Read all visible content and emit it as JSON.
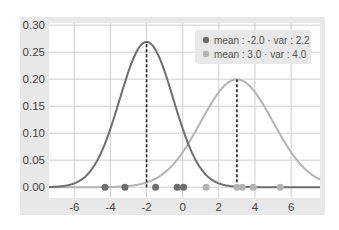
{
  "chart_data": {
    "type": "line",
    "title": "",
    "xlabel": "",
    "ylabel": "",
    "xlim": [
      -7.4,
      7.6
    ],
    "ylim": [
      -0.02,
      0.304
    ],
    "grid": true,
    "legend_position": "upper right",
    "x_ticks": [
      -6,
      -4,
      -2,
      0,
      2,
      4,
      6
    ],
    "x_tick_labels": [
      "-6",
      "-4",
      "-2",
      "0",
      "2",
      "4",
      "6"
    ],
    "y_ticks": [
      0.0,
      0.05,
      0.1,
      0.15,
      0.2,
      0.25,
      0.3
    ],
    "y_tick_labels": [
      "0.00",
      "0.05",
      "0.10",
      "0.15",
      "0.20",
      "0.25",
      "0.30"
    ],
    "series": [
      {
        "name": "mean : -2.0 · var : 2.2",
        "kind": "gaussian_pdf",
        "mean": -2.0,
        "var": 2.2,
        "peak": 0.269,
        "color": "#6e6e6e",
        "mean_marker": "dashed vertical line at x=-2.0 from 0 to peak",
        "samples": [
          -4.3,
          -3.2,
          -1.5,
          -0.3,
          0.05
        ]
      },
      {
        "name": "mean : 3.0 · var : 4.0",
        "kind": "gaussian_pdf",
        "mean": 3.0,
        "var": 4.0,
        "peak": 0.199,
        "color": "#b3b3b3",
        "mean_marker": "dashed vertical line at x=3.0 from 0 to peak",
        "samples": [
          1.3,
          3.0,
          3.3,
          3.9,
          5.4
        ]
      }
    ]
  },
  "legend": {
    "items": [
      {
        "label": "mean : -2.0 · var : 2.2",
        "color": "#6e6e6e"
      },
      {
        "label": "mean : 3.0 · var : 4.0",
        "color": "#b3b3b3"
      }
    ]
  },
  "style": {
    "frame_bg": "#e6e6e6",
    "plot_bg": "#ffffff",
    "grid_color": "#cfcfcf"
  }
}
